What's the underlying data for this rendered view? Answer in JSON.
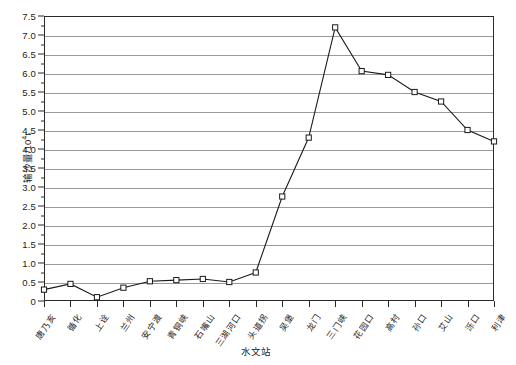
{
  "chart_data": {
    "type": "line",
    "title": "",
    "xlabel": "水文站",
    "ylabel": "输沙量/10⁴t",
    "ylabel_base": "输沙量/10",
    "ylabel_exp": "4",
    "ylabel_unit": "t",
    "ylim": [
      0,
      7.5
    ],
    "ytick_step": 0.5,
    "grid": true,
    "legend": "none",
    "categories": [
      "唐乃亥",
      "循化",
      "上诠",
      "兰州",
      "安宁渡",
      "青铜峡",
      "石嘴山",
      "三湖河口",
      "头道拐",
      "吴堡",
      "龙门",
      "三门峡",
      "花园口",
      "高村",
      "孙口",
      "艾山",
      "泺口",
      "利津"
    ],
    "values": [
      0.3,
      0.45,
      0.1,
      0.35,
      0.52,
      0.55,
      0.58,
      0.5,
      0.75,
      2.75,
      4.3,
      7.2,
      6.05,
      5.95,
      5.5,
      5.25,
      4.5,
      4.2
    ],
    "ytick_labels": [
      "0",
      "0.5",
      "1.0",
      "1.5",
      "2.0",
      "2.5",
      "3.0",
      "3.5",
      "4.0",
      "4.5",
      "5.0",
      "5.5",
      "6.0",
      "6.5",
      "7.0",
      "7.5"
    ],
    "marker": "open-square",
    "line_color": "#1a1a1a",
    "grid_color": "#9a9a9a",
    "axis_color": "#2b2b2b",
    "background": "#ffffff"
  }
}
